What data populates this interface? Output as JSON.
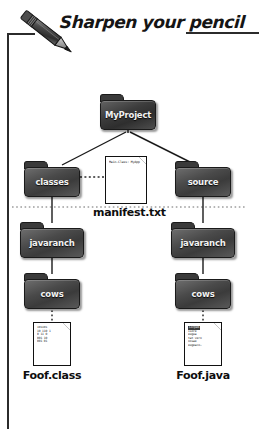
{
  "page": {
    "header_title": "Sharpen your pencil",
    "pencil_icon": "pencil-icon"
  },
  "diagram": {
    "type": "tree",
    "root": "MyProject",
    "folders": [
      {
        "id": "myproject",
        "label": "MyProject"
      },
      {
        "id": "classes",
        "label": "classes"
      },
      {
        "id": "source",
        "label": "source"
      },
      {
        "id": "javaranch_classes",
        "label": "javaranch"
      },
      {
        "id": "javaranch_source",
        "label": "javaranch"
      },
      {
        "id": "cows_classes",
        "label": "cows"
      },
      {
        "id": "cows_source",
        "label": "cows"
      }
    ],
    "documents": [
      {
        "id": "manifest",
        "caption": "manifest.txt",
        "lines": [
          "Main-Class: MyApp"
        ]
      },
      {
        "id": "foofclass",
        "caption": "Foof.class",
        "lines": [
          "101101",
          "10 110 1",
          "0 11 0",
          "001 10",
          "001 01"
        ]
      },
      {
        "id": "foofjava",
        "caption": "Foof.java",
        "lines": [
          "Lorpem",
          "isore",
          "eugua",
          "tat vero",
          "oosae",
          "eugeaco~"
        ]
      }
    ]
  }
}
